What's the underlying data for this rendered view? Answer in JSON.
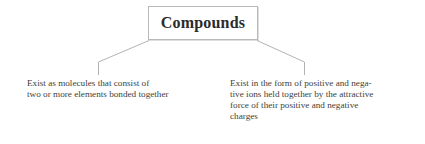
{
  "diagram": {
    "type": "tree-diagram",
    "root": {
      "label": "Compounds"
    },
    "branches": [
      {
        "id": "molecular-compounds",
        "lines": [
          "Exist as molecules that consist of",
          "two or more elements bonded together"
        ]
      },
      {
        "id": "ionic-compounds",
        "lines": [
          "Exist in the form of positive and nega-",
          "tive ions held together by the attractive",
          "force of their positive and negative",
          "charges"
        ]
      }
    ],
    "colors": {
      "background": "#ffffff",
      "box_border": "#b9b9b9",
      "connector": "#b3b3b3",
      "title_text": "#2b2b2b",
      "body_text": "#403f3d"
    }
  }
}
